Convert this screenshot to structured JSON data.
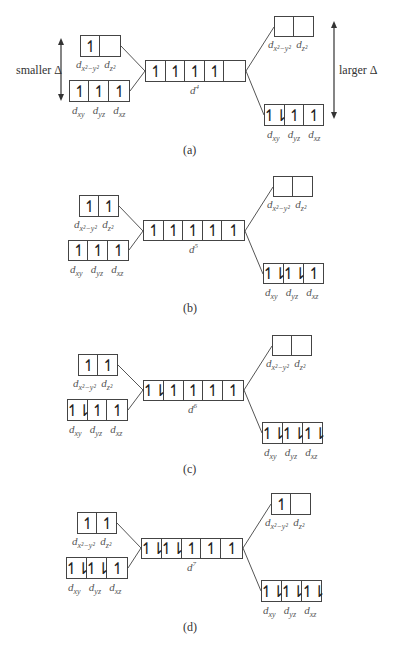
{
  "figure": {
    "side_labels": {
      "left": "smaller Δ",
      "right": "larger Δ"
    },
    "orbital_labels": {
      "eg": [
        "d_{x²−y²}",
        "d_{z²}"
      ],
      "t2g": [
        "d_{xy}",
        "d_{yz}",
        "d_{xz}"
      ]
    },
    "panels": [
      {
        "caption": "(a)",
        "config": "d",
        "config_sup": "4",
        "free_ion": [
          "↿",
          "↿",
          "↿",
          "↿",
          ""
        ],
        "weak_field": {
          "eg": [
            "↿",
            ""
          ],
          "t2g": [
            "↿",
            "↿",
            "↿"
          ]
        },
        "strong_field": {
          "eg": [
            "",
            ""
          ],
          "t2g": [
            "↿⇂",
            "↿",
            "↿"
          ]
        }
      },
      {
        "caption": "(b)",
        "config": "d",
        "config_sup": "5",
        "free_ion": [
          "↿",
          "↿",
          "↿",
          "↿",
          "↿"
        ],
        "weak_field": {
          "eg": [
            "↿",
            "↿"
          ],
          "t2g": [
            "↿",
            "↿",
            "↿"
          ]
        },
        "strong_field": {
          "eg": [
            "",
            ""
          ],
          "t2g": [
            "↿⇂",
            "↿⇂",
            "↿"
          ]
        }
      },
      {
        "caption": "(c)",
        "config": "d",
        "config_sup": "6",
        "free_ion": [
          "↿⇂",
          "↿",
          "↿",
          "↿",
          "↿"
        ],
        "weak_field": {
          "eg": [
            "↿",
            "↿"
          ],
          "t2g": [
            "↿⇂",
            "↿",
            "↿"
          ]
        },
        "strong_field": {
          "eg": [
            "",
            ""
          ],
          "t2g": [
            "↿⇂",
            "↿⇂",
            "↿⇂"
          ]
        }
      },
      {
        "caption": "(d)",
        "config": "d",
        "config_sup": "7",
        "free_ion": [
          "↿⇂",
          "↿⇂",
          "↿",
          "↿",
          "↿"
        ],
        "weak_field": {
          "eg": [
            "↿",
            "↿"
          ],
          "t2g": [
            "↿⇂",
            "↿⇂",
            "↿"
          ]
        },
        "strong_field": {
          "eg": [
            "↿",
            ""
          ],
          "t2g": [
            "↿⇂",
            "↿⇂",
            "↿⇂"
          ]
        }
      }
    ]
  }
}
